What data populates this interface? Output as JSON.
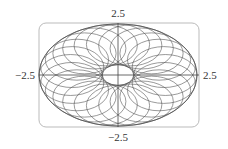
{
  "chart_data": {
    "type": "line",
    "title": "",
    "xlabel": "",
    "ylabel": "",
    "xlim": [
      -2.5,
      2.5
    ],
    "ylim": [
      -2.5,
      2.5
    ],
    "grid": false,
    "legend": null,
    "axis_labels": {
      "top": "2.5",
      "bottom": "−2.5",
      "left": "−2.5",
      "right": "2.5"
    },
    "outer_boundary": {
      "a": 2.5,
      "b": 1.62
    },
    "inner_hole": {
      "a": 0.5,
      "b": 0.33
    },
    "curve_family": {
      "count": 24,
      "center_path": {
        "a": 1.5,
        "b": 0.975
      },
      "loop_radius": {
        "a": 1.0,
        "b": 0.65
      }
    },
    "line_color": "#555555",
    "frame_color": "#bbbbbb"
  }
}
